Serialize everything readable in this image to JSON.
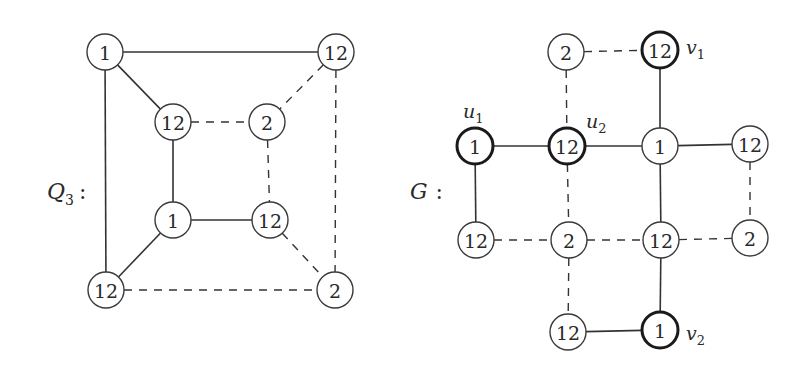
{
  "diagram": {
    "type": "graph-colorings",
    "graphs": [
      {
        "id": "Q3",
        "label": "Q",
        "label_sub": "3",
        "label_colon": ":",
        "label_pos": [
          47,
          192
        ],
        "node_radius": 18,
        "nodes": [
          {
            "id": "q_tl",
            "text": "1",
            "x": 105,
            "y": 52,
            "bold": false
          },
          {
            "id": "q_tr",
            "text": "12",
            "x": 336,
            "y": 52,
            "bold": false
          },
          {
            "id": "q_itl",
            "text": "12",
            "x": 173,
            "y": 122,
            "bold": false
          },
          {
            "id": "q_itr",
            "text": "2",
            "x": 267,
            "y": 122,
            "bold": false
          },
          {
            "id": "q_ibl",
            "text": "1",
            "x": 173,
            "y": 220,
            "bold": false
          },
          {
            "id": "q_ibr",
            "text": "12",
            "x": 270,
            "y": 220,
            "bold": false
          },
          {
            "id": "q_bl",
            "text": "12",
            "x": 106,
            "y": 290,
            "bold": false
          },
          {
            "id": "q_br",
            "text": "2",
            "x": 335,
            "y": 290,
            "bold": false
          }
        ],
        "edges": [
          {
            "from": "q_tl",
            "to": "q_tr",
            "style": "solid"
          },
          {
            "from": "q_tl",
            "to": "q_itl",
            "style": "solid"
          },
          {
            "from": "q_tl",
            "to": "q_bl",
            "style": "solid"
          },
          {
            "from": "q_tr",
            "to": "q_itr",
            "style": "dashed"
          },
          {
            "from": "q_tr",
            "to": "q_br",
            "style": "dashed"
          },
          {
            "from": "q_itl",
            "to": "q_itr",
            "style": "dashed"
          },
          {
            "from": "q_itl",
            "to": "q_ibl",
            "style": "solid"
          },
          {
            "from": "q_itr",
            "to": "q_ibr",
            "style": "dashed"
          },
          {
            "from": "q_ibl",
            "to": "q_ibr",
            "style": "solid"
          },
          {
            "from": "q_ibl",
            "to": "q_bl",
            "style": "solid"
          },
          {
            "from": "q_ibr",
            "to": "q_br",
            "style": "dashed"
          },
          {
            "from": "q_bl",
            "to": "q_br",
            "style": "dashed"
          }
        ],
        "vertex_labels": []
      },
      {
        "id": "G",
        "label": "G",
        "label_sub": "",
        "label_colon": ":",
        "label_pos": [
          410,
          192
        ],
        "node_radius": 18,
        "nodes": [
          {
            "id": "g_a",
            "text": "2",
            "x": 566,
            "y": 52,
            "bold": false
          },
          {
            "id": "g_v1",
            "text": "12",
            "x": 660,
            "y": 50,
            "bold": true
          },
          {
            "id": "g_u1",
            "text": "1",
            "x": 475,
            "y": 146,
            "bold": true
          },
          {
            "id": "g_u2",
            "text": "12",
            "x": 567,
            "y": 146,
            "bold": true
          },
          {
            "id": "g_c",
            "text": "1",
            "x": 660,
            "y": 146,
            "bold": false
          },
          {
            "id": "g_d",
            "text": "12",
            "x": 750,
            "y": 144,
            "bold": false
          },
          {
            "id": "g_e",
            "text": "12",
            "x": 476,
            "y": 240,
            "bold": false
          },
          {
            "id": "g_f",
            "text": "2",
            "x": 569,
            "y": 240,
            "bold": false
          },
          {
            "id": "g_g",
            "text": "12",
            "x": 661,
            "y": 240,
            "bold": false
          },
          {
            "id": "g_h",
            "text": "2",
            "x": 750,
            "y": 238,
            "bold": false
          },
          {
            "id": "g_i",
            "text": "12",
            "x": 568,
            "y": 332,
            "bold": false
          },
          {
            "id": "g_v2",
            "text": "1",
            "x": 660,
            "y": 330,
            "bold": true
          }
        ],
        "edges": [
          {
            "from": "g_a",
            "to": "g_v1",
            "style": "dashed"
          },
          {
            "from": "g_a",
            "to": "g_u2",
            "style": "dashed"
          },
          {
            "from": "g_v1",
            "to": "g_c",
            "style": "solid"
          },
          {
            "from": "g_u1",
            "to": "g_u2",
            "style": "solid"
          },
          {
            "from": "g_u1",
            "to": "g_e",
            "style": "solid"
          },
          {
            "from": "g_u2",
            "to": "g_c",
            "style": "solid"
          },
          {
            "from": "g_u2",
            "to": "g_f",
            "style": "dashed"
          },
          {
            "from": "g_c",
            "to": "g_d",
            "style": "solid"
          },
          {
            "from": "g_c",
            "to": "g_g",
            "style": "solid"
          },
          {
            "from": "g_d",
            "to": "g_h",
            "style": "dashed"
          },
          {
            "from": "g_e",
            "to": "g_f",
            "style": "dashed"
          },
          {
            "from": "g_f",
            "to": "g_g",
            "style": "dashed"
          },
          {
            "from": "g_f",
            "to": "g_i",
            "style": "dashed"
          },
          {
            "from": "g_g",
            "to": "g_h",
            "style": "dashed"
          },
          {
            "from": "g_g",
            "to": "g_v2",
            "style": "solid"
          },
          {
            "from": "g_i",
            "to": "g_v2",
            "style": "solid"
          }
        ],
        "vertex_labels": [
          {
            "for": "g_v1",
            "text": "v",
            "sub": "1",
            "x": 686,
            "y": 54
          },
          {
            "for": "g_u1",
            "text": "u",
            "sub": "1",
            "x": 463,
            "y": 118
          },
          {
            "for": "g_u2",
            "text": "u",
            "sub": "2",
            "x": 586,
            "y": 128
          },
          {
            "for": "g_v2",
            "text": "v",
            "sub": "2",
            "x": 686,
            "y": 340
          }
        ]
      }
    ]
  }
}
